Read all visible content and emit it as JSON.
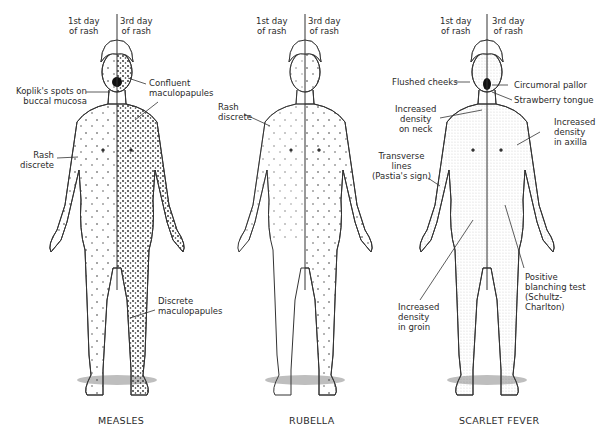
{
  "figure": {
    "panels": [
      {
        "id": "measles",
        "caption": "MEASLES",
        "day_left": "1st day\nof rash",
        "day_right": "3rd day\nof rash",
        "labels": [
          {
            "key": "koplik",
            "text": "Koplik's spots on\nbuccal mucosa"
          },
          {
            "key": "confluent",
            "text": "Confluent\nmaculopapules"
          },
          {
            "key": "rash_discrete",
            "text": "Rash\ndiscrete"
          },
          {
            "key": "discrete_maculopapules",
            "text": "Discrete\nmaculopapules"
          }
        ]
      },
      {
        "id": "rubella",
        "caption": "RUBELLA",
        "day_left": "1st day\nof rash",
        "day_right": "3rd day\nof rash",
        "labels": [
          {
            "key": "rash_discrete",
            "text": "Rash\ndiscrete"
          }
        ]
      },
      {
        "id": "scarlet_fever",
        "caption": "SCARLET FEVER",
        "day_left": "1st day\nof rash",
        "day_right": "3rd day\nof rash",
        "labels": [
          {
            "key": "flushed",
            "text": "Flushed cheeks"
          },
          {
            "key": "circumoral",
            "text": "Circumoral pallor"
          },
          {
            "key": "strawberry",
            "text": "Strawberry tongue"
          },
          {
            "key": "neck",
            "text": "Increased\ndensity\non neck"
          },
          {
            "key": "axilla",
            "text": "Increased\ndensity\nin axilla"
          },
          {
            "key": "pastia",
            "text": "Transverse\nlines\n(Pastia's sign)"
          },
          {
            "key": "blanching",
            "text": "Positive\nblanching test\n(Schultz-\nCharlton)"
          },
          {
            "key": "groin",
            "text": "Increased\ndensity\nin groin"
          }
        ]
      }
    ]
  }
}
